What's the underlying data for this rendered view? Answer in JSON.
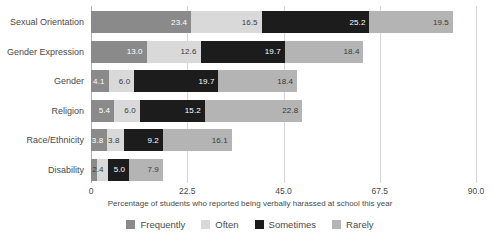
{
  "chart_data": {
    "type": "bar",
    "orientation": "horizontal",
    "stacked": true,
    "title": "",
    "xlabel": "Percentage of students who reported being verbally harassed at school this year",
    "ylabel": "",
    "xlim": [
      0,
      90
    ],
    "xticks": [
      "0",
      "22.5",
      "45.0",
      "67.5",
      "90.0"
    ],
    "xtick_values": [
      0,
      22.5,
      45.0,
      67.5,
      90.0
    ],
    "grid": true,
    "legend_position": "bottom",
    "categories": [
      "Sexual Orientation",
      "Gender Expression",
      "Gender",
      "Religion",
      "Race/Ethnicity",
      "Disability"
    ],
    "series": [
      {
        "name": "Frequently",
        "color": "#8a8a8a",
        "values": [
          23.4,
          13.0,
          4.1,
          5.4,
          3.8,
          1.5
        ]
      },
      {
        "name": "Often",
        "color": "#d9d9d9",
        "values": [
          16.5,
          12.6,
          6.0,
          6.0,
          3.8,
          2.4
        ]
      },
      {
        "name": "Sometimes",
        "color": "#1c1c1c",
        "values": [
          25.2,
          19.7,
          19.7,
          15.2,
          9.2,
          5.0
        ]
      },
      {
        "name": "Rarely",
        "color": "#b4b4b4",
        "values": [
          19.5,
          18.4,
          18.4,
          22.8,
          16.1,
          7.9
        ]
      }
    ],
    "bar_labels": [
      [
        "23.4",
        "16.5",
        "25.2",
        "19.5"
      ],
      [
        "13.0",
        "12.6",
        "19.7",
        "18.4"
      ],
      [
        "4.1",
        "6.0",
        "19.7",
        "18.4"
      ],
      [
        "5.4",
        "6.0",
        "15.2",
        "22.8"
      ],
      [
        "3.8",
        "3.8",
        "9.2",
        "16.1"
      ],
      [
        "",
        "2.4",
        "5.0",
        "7.9"
      ]
    ]
  },
  "legend": {
    "items": [
      {
        "label": "Frequently",
        "color": "#8a8a8a"
      },
      {
        "label": "Often",
        "color": "#d9d9d9"
      },
      {
        "label": "Sometimes",
        "color": "#1c1c1c"
      },
      {
        "label": "Rarely",
        "color": "#b4b4b4"
      }
    ]
  }
}
